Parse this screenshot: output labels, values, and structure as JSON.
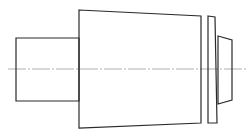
{
  "drawing": {
    "type": "stepped shaft side view",
    "colors": {
      "outline": "#2a2a2a",
      "centerline": "#9a9a9a",
      "background": "#ffffff"
    },
    "parts": [
      {
        "name": "small-cylinder",
        "shape": "rectangle",
        "points": [
          [
            16,
            38
          ],
          [
            79,
            38
          ],
          [
            79,
            101
          ],
          [
            16,
            101
          ]
        ]
      },
      {
        "name": "tapered-body",
        "shape": "trapezoid",
        "points": [
          [
            79,
            10
          ],
          [
            201,
            16
          ],
          [
            201,
            123
          ],
          [
            79,
            128
          ]
        ]
      },
      {
        "name": "flange-plate",
        "shape": "quad",
        "points": [
          [
            208,
            16
          ],
          [
            215,
            17
          ],
          [
            217,
            123
          ],
          [
            208,
            123
          ]
        ]
      },
      {
        "name": "end-cap",
        "shape": "trapezoid",
        "points": [
          [
            218,
            36
          ],
          [
            232,
            40
          ],
          [
            232,
            100
          ],
          [
            218,
            104
          ]
        ]
      }
    ],
    "centerline": {
      "x1": 8,
      "x2": 246,
      "y": 69
    }
  }
}
